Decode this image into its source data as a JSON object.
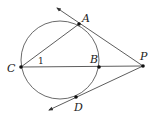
{
  "diagram": {
    "type": "geometry",
    "circle": {
      "cx": 60,
      "cy": 59,
      "r": 39
    },
    "points": {
      "A": {
        "label": "A",
        "x": 79,
        "y": 24,
        "lx": 82,
        "ly": 19
      },
      "B": {
        "label": "B",
        "x": 99,
        "y": 67,
        "lx": 90,
        "ly": 62
      },
      "C": {
        "label": "C",
        "x": 21,
        "y": 67,
        "lx": 8,
        "ly": 71
      },
      "D": {
        "label": "D",
        "x": 76,
        "y": 97,
        "lx": 74,
        "ly": 110
      },
      "P": {
        "label": "P",
        "x": 143,
        "y": 66,
        "lx": 140,
        "ly": 58
      }
    },
    "angle_label": {
      "text": "1",
      "x": 39,
      "y": 64
    },
    "colors": {
      "stroke": "#333333",
      "point": "#111111",
      "background": "#ffffff"
    }
  }
}
